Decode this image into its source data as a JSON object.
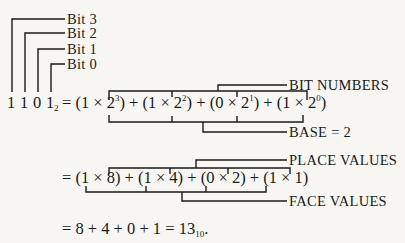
{
  "bit_labels": [
    "Bit 3",
    "Bit 2",
    "Bit 1",
    "Bit 0"
  ],
  "binary_digits": [
    "1",
    "1",
    "0",
    "1"
  ],
  "binary_subscript": "2",
  "line1": {
    "prefix": "= (1 × 2",
    "e3": "3",
    "p2": ") + (1 × 2",
    "e2": "2",
    "p3": ") + (0 × 2",
    "e1": "1",
    "p4": ") + (1 × 2",
    "e0": "0",
    "suffix": ")"
  },
  "annotations": {
    "bit_numbers": "BIT NUMBERS",
    "base": "BASE = 2",
    "place_values": "PLACE VALUES",
    "face_values": "FACE VALUES"
  },
  "line2": "= (1 × 8) + (1 × 4) + (0 × 2) + (1 × 1)",
  "line3": {
    "text": "= 8 + 4 + 0 + 1 = 13",
    "subscript": "10",
    "end": "."
  }
}
